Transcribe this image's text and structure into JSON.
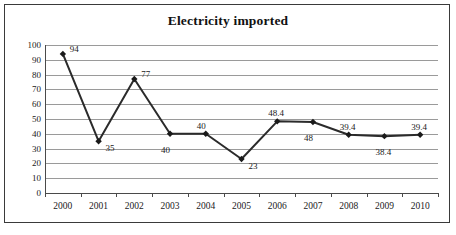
{
  "chart_data": {
    "type": "line",
    "title": "Electricity imported",
    "xlabel": "",
    "ylabel": "",
    "categories": [
      "2000",
      "2001",
      "2002",
      "2003",
      "2004",
      "2005",
      "2006",
      "2007",
      "2008",
      "2009",
      "2010"
    ],
    "values": [
      94,
      35,
      77,
      40,
      40,
      23,
      48.4,
      48,
      39.4,
      38.4,
      39.4
    ],
    "point_labels": [
      "94",
      "35",
      "77",
      "40",
      "40",
      "23",
      "48.4",
      "48",
      "39.4",
      "38.4",
      "39.4"
    ],
    "point_label_positions": [
      "above-right",
      "below-right",
      "above-right",
      "below",
      "above",
      "below-right",
      "above",
      "below",
      "above",
      "below",
      "above"
    ],
    "ylim": [
      0,
      100
    ],
    "ytick_values": [
      0,
      10,
      20,
      30,
      40,
      50,
      60,
      70,
      80,
      90,
      100
    ],
    "ytick_labels": [
      "0",
      "10",
      "20",
      "30",
      "40",
      "50",
      "60",
      "70",
      "80",
      "90",
      "100"
    ],
    "grid": true,
    "legend": false,
    "marker": "diamond",
    "series": [
      {
        "name": "Electricity imported",
        "values": [
          94,
          35,
          77,
          40,
          40,
          23,
          48.4,
          48,
          39.4,
          38.4,
          39.4
        ]
      }
    ],
    "colors": {
      "line": "#2b2b2b",
      "marker": "#1a1a1a",
      "gridline": "#9a9a9a",
      "axis": "#4a4a4a",
      "text": "#1a1a1a",
      "border": "#3a3a3a",
      "background": "#ffffff"
    }
  }
}
